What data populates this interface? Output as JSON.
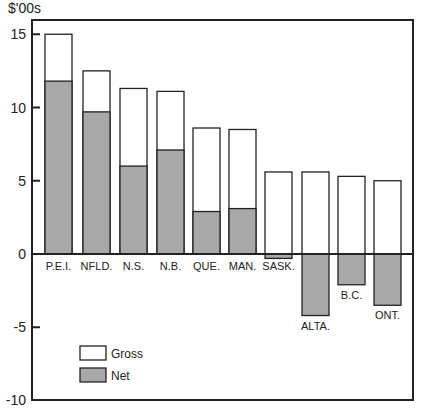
{
  "chart_data": {
    "type": "bar",
    "title": "",
    "ylabel": "$'00s",
    "xlabel": "",
    "ylim": [
      -10,
      16.5
    ],
    "yticks": [
      -10,
      -5,
      0,
      5,
      10,
      15
    ],
    "grid": false,
    "legend_position": "lower-left",
    "categories": [
      "P.E.I.",
      "NFLD.",
      "N.S.",
      "N.B.",
      "QUE.",
      "MAN.",
      "SASK.",
      "ALTA.",
      "B.C.",
      "ONT."
    ],
    "series": [
      {
        "name": "Gross",
        "color": "#ffffff",
        "values": [
          15.0,
          12.5,
          11.3,
          11.1,
          8.6,
          8.5,
          5.6,
          5.6,
          5.3,
          5.0
        ]
      },
      {
        "name": "Net",
        "color": "#a8a8a8",
        "values": [
          11.8,
          9.7,
          6.0,
          7.1,
          2.9,
          3.1,
          -0.3,
          -4.2,
          -2.1,
          -3.5
        ]
      }
    ]
  },
  "axis": {
    "unit_label": "$'00s"
  },
  "legend": {
    "gross_label": "Gross",
    "net_label": "Net"
  }
}
